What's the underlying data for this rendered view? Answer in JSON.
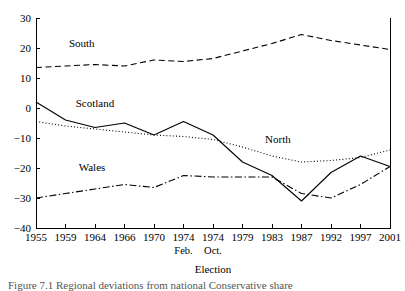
{
  "figure": {
    "caption": "Figure 7.1   Regional deviations from national Conservative share"
  },
  "chart_data": {
    "type": "line",
    "title": "",
    "xlabel": "Election",
    "ylabel": "",
    "ylim": [
      -40,
      30
    ],
    "yticks": [
      30,
      20,
      10,
      0,
      -10,
      -20,
      -30,
      -40
    ],
    "ytick_labels": [
      "30",
      "20",
      "10",
      "0",
      "−10",
      "−20",
      "−30",
      "−40"
    ],
    "grid": false,
    "legend": "inline-labels",
    "categories": [
      "1955",
      "1959",
      "1964",
      "1966",
      "1970",
      "1974",
      "1974",
      "1979",
      "1983",
      "1987",
      "1992",
      "1997",
      "2001"
    ],
    "category_sublabels": [
      "",
      "",
      "",
      "",
      "",
      "Feb.",
      "Oct.",
      "",
      "",
      "",
      "",
      "",
      ""
    ],
    "series": [
      {
        "name": "South",
        "label": "South",
        "style": "dashed",
        "values": [
          13.5,
          14.0,
          14.5,
          14.0,
          16.0,
          15.5,
          16.5,
          19.0,
          21.5,
          24.5,
          22.5,
          21.0,
          19.5
        ]
      },
      {
        "name": "Scotland",
        "label": "Scotland",
        "style": "solid",
        "values": [
          2.0,
          -4.0,
          -6.5,
          -5.0,
          -9.0,
          -4.5,
          -9.0,
          -18.0,
          -22.5,
          -31.0,
          -21.5,
          -16.0,
          -19.5
        ]
      },
      {
        "name": "North",
        "label": "North",
        "style": "dotted",
        "values": [
          -4.5,
          -6.0,
          -7.0,
          -8.0,
          -9.0,
          -9.5,
          -10.5,
          -13.0,
          -16.0,
          -18.0,
          -17.5,
          -16.5,
          -14.0
        ]
      },
      {
        "name": "Wales",
        "label": "Wales",
        "style": "dashdot",
        "values": [
          -30.0,
          -28.5,
          -27.0,
          -25.5,
          -26.5,
          -22.5,
          -23.0,
          -23.0,
          -23.0,
          -28.5,
          -30.0,
          -25.5,
          -19.5
        ]
      }
    ],
    "annotations": [
      {
        "text": "South",
        "x": 1.55,
        "y": 20.5
      },
      {
        "text": "Scotland",
        "x": 2.0,
        "y": 0.2
      },
      {
        "text": "North",
        "x": 8.2,
        "y": -11.5
      },
      {
        "text": "Wales",
        "x": 1.9,
        "y": -21.0
      }
    ]
  }
}
